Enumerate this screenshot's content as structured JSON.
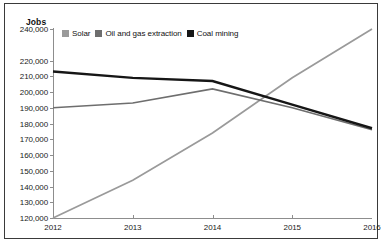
{
  "chart_data": {
    "type": "line",
    "title": "",
    "ylabel": "Jobs",
    "xlabel": "",
    "x": [
      "2012",
      "2013",
      "2014",
      "2015",
      "2016"
    ],
    "ytick_labels": [
      "240,000",
      "220,000",
      "210,000",
      "200,000",
      "190,000",
      "180,000",
      "170,000",
      "160,000",
      "150,000",
      "140,000",
      "130,000",
      "120,000"
    ],
    "ylim": [
      120000,
      240000
    ],
    "grid": false,
    "legend_position": "top-left-inside",
    "series": [
      {
        "name": "Solar",
        "color": "#9a9a9a",
        "values": [
          120000,
          144000,
          174000,
          209000,
          240000
        ]
      },
      {
        "name": "Oil and gas extraction",
        "color": "#6e6e6e",
        "values": [
          190000,
          193000,
          202000,
          190000,
          176000
        ]
      },
      {
        "name": "Coal mining",
        "color": "#161616",
        "values": [
          213000,
          209000,
          207000,
          192000,
          177000
        ]
      }
    ]
  },
  "axis": {
    "y_title": "Jobs"
  },
  "legend": {
    "items": [
      {
        "label": "Solar",
        "color": "#9a9a9a"
      },
      {
        "label": "Oil and gas extraction",
        "color": "#6e6e6e"
      },
      {
        "label": "Coal mining",
        "color": "#161616"
      }
    ]
  }
}
